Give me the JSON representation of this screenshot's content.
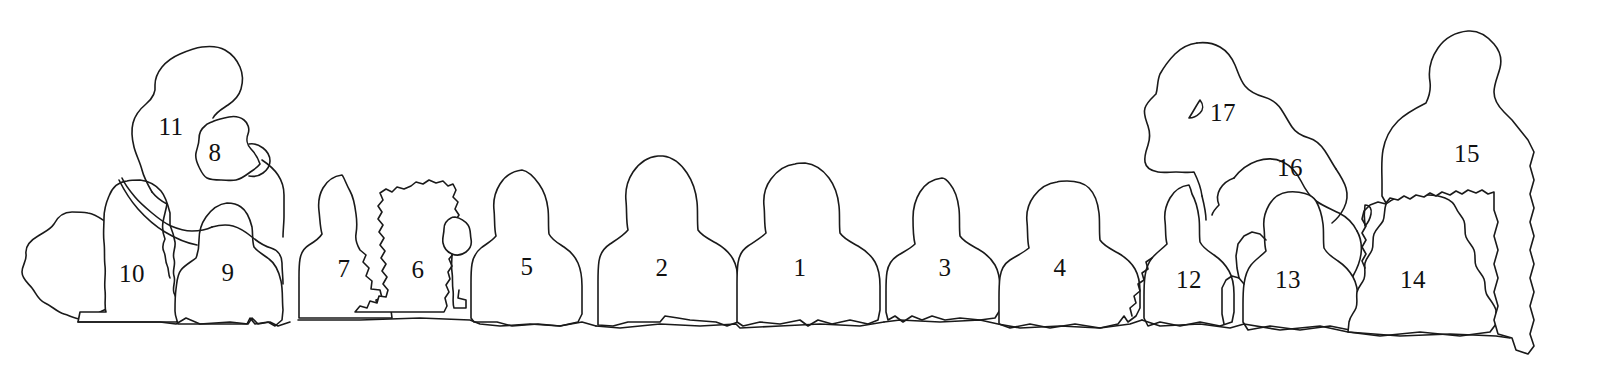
{
  "canvas": {
    "width": 1604,
    "height": 380,
    "background_color": "#ffffff",
    "line_color": "#1a1a1a",
    "label_color": "#111111"
  },
  "diagram": {
    "type": "photo-identification-key",
    "person_count": 17
  },
  "labels": [
    {
      "id": "label-1",
      "text": "1",
      "x": 800,
      "y": 267
    },
    {
      "id": "label-2",
      "text": "2",
      "x": 662,
      "y": 267
    },
    {
      "id": "label-3",
      "text": "3",
      "x": 945,
      "y": 267
    },
    {
      "id": "label-4",
      "text": "4",
      "x": 1060,
      "y": 267
    },
    {
      "id": "label-5",
      "text": "5",
      "x": 527,
      "y": 266
    },
    {
      "id": "label-6",
      "text": "6",
      "x": 418,
      "y": 269
    },
    {
      "id": "label-7",
      "text": "7",
      "x": 344,
      "y": 268
    },
    {
      "id": "label-8",
      "text": "8",
      "x": 215,
      "y": 152
    },
    {
      "id": "label-9",
      "text": "9",
      "x": 228,
      "y": 272
    },
    {
      "id": "label-10",
      "text": "10",
      "x": 132,
      "y": 273
    },
    {
      "id": "label-11",
      "text": "11",
      "x": 171,
      "y": 126
    },
    {
      "id": "label-12",
      "text": "12",
      "x": 1189,
      "y": 279
    },
    {
      "id": "label-13",
      "text": "13",
      "x": 1288,
      "y": 279
    },
    {
      "id": "label-14",
      "text": "14",
      "x": 1413,
      "y": 279
    },
    {
      "id": "label-15",
      "text": "15",
      "x": 1467,
      "y": 153
    },
    {
      "id": "label-16",
      "text": "16",
      "x": 1290,
      "y": 167
    },
    {
      "id": "label-17",
      "text": "17",
      "x": 1223,
      "y": 112
    }
  ]
}
